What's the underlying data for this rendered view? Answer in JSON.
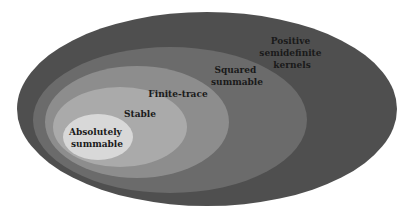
{
  "diagram": {
    "type": "nested-sets",
    "sets": [
      {
        "label_lines": [
          "Positive",
          "semidefinite",
          "kernels"
        ],
        "color": "#4f4f4f"
      },
      {
        "label_lines": [
          "Squared",
          "summable"
        ],
        "color": "#6b6b6b"
      },
      {
        "label_lines": [
          "Finite-trace"
        ],
        "color": "#8d8d8d"
      },
      {
        "label_lines": [
          "Stable"
        ],
        "color": "#aaaaaa"
      },
      {
        "label_lines": [
          "Absolutely",
          "summable"
        ],
        "color": "#d8d8d8"
      }
    ]
  }
}
